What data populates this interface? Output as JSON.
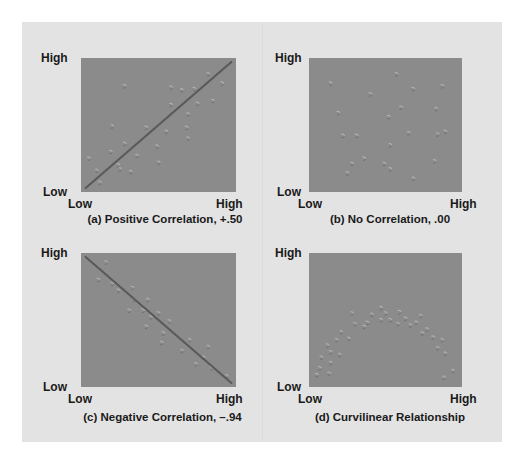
{
  "chart_data": [
    {
      "id": "a",
      "type": "scatter",
      "title": "(a) Positive Correlation, +.50",
      "xlabel": "",
      "ylabel": "",
      "x_ticks": [
        "Low",
        "High"
      ],
      "y_ticks": [
        "Low",
        "High"
      ],
      "xlim": [
        0,
        1
      ],
      "ylim": [
        0,
        1
      ],
      "grid": false,
      "trend_line": {
        "from": [
          0.03,
          0.03
        ],
        "to": [
          0.97,
          0.97
        ]
      },
      "points": [
        [
          0.28,
          0.79
        ],
        [
          0.58,
          0.78
        ],
        [
          0.65,
          0.76
        ],
        [
          0.73,
          0.77
        ],
        [
          0.82,
          0.88
        ],
        [
          0.91,
          0.81
        ],
        [
          0.75,
          0.66
        ],
        [
          0.85,
          0.68
        ],
        [
          0.58,
          0.65
        ],
        [
          0.69,
          0.58
        ],
        [
          0.68,
          0.48
        ],
        [
          0.42,
          0.48
        ],
        [
          0.2,
          0.49
        ],
        [
          0.55,
          0.45
        ],
        [
          0.69,
          0.4
        ],
        [
          0.28,
          0.36
        ],
        [
          0.49,
          0.34
        ],
        [
          0.19,
          0.3
        ],
        [
          0.05,
          0.25
        ],
        [
          0.36,
          0.27
        ],
        [
          0.25,
          0.17
        ],
        [
          0.1,
          0.16
        ],
        [
          0.32,
          0.15
        ],
        [
          0.24,
          0.2
        ],
        [
          0.5,
          0.22
        ],
        [
          0.12,
          0.07
        ]
      ]
    },
    {
      "id": "b",
      "type": "scatter",
      "title": "(b) No Correlation, .00",
      "xlabel": "",
      "ylabel": "",
      "x_ticks": [
        "Low",
        "High"
      ],
      "y_ticks": [
        "Low",
        "High"
      ],
      "xlim": [
        0,
        1
      ],
      "ylim": [
        0,
        1
      ],
      "grid": false,
      "points": [
        [
          0.57,
          0.88
        ],
        [
          0.14,
          0.81
        ],
        [
          0.4,
          0.73
        ],
        [
          0.68,
          0.77
        ],
        [
          0.87,
          0.79
        ],
        [
          0.6,
          0.63
        ],
        [
          0.83,
          0.62
        ],
        [
          0.19,
          0.59
        ],
        [
          0.52,
          0.56
        ],
        [
          0.22,
          0.42
        ],
        [
          0.31,
          0.42
        ],
        [
          0.65,
          0.44
        ],
        [
          0.84,
          0.43
        ],
        [
          0.89,
          0.45
        ],
        [
          0.53,
          0.35
        ],
        [
          0.28,
          0.21
        ],
        [
          0.49,
          0.21
        ],
        [
          0.82,
          0.23
        ],
        [
          0.25,
          0.14
        ],
        [
          0.53,
          0.17
        ],
        [
          0.68,
          0.1
        ],
        [
          0.36,
          0.25
        ]
      ]
    },
    {
      "id": "c",
      "type": "scatter",
      "title": "(c) Negative Correlation, –.94",
      "xlabel": "",
      "ylabel": "",
      "x_ticks": [
        "Low",
        "High"
      ],
      "y_ticks": [
        "Low",
        "High"
      ],
      "xlim": [
        0,
        1
      ],
      "ylim": [
        0,
        1
      ],
      "grid": false,
      "trend_line": {
        "from": [
          0.03,
          0.97
        ],
        "to": [
          0.97,
          0.03
        ]
      },
      "points": [
        [
          0.16,
          0.93
        ],
        [
          0.11,
          0.8
        ],
        [
          0.2,
          0.77
        ],
        [
          0.24,
          0.72
        ],
        [
          0.33,
          0.74
        ],
        [
          0.34,
          0.65
        ],
        [
          0.43,
          0.65
        ],
        [
          0.31,
          0.57
        ],
        [
          0.4,
          0.57
        ],
        [
          0.5,
          0.55
        ],
        [
          0.45,
          0.52
        ],
        [
          0.57,
          0.49
        ],
        [
          0.42,
          0.45
        ],
        [
          0.53,
          0.4
        ],
        [
          0.52,
          0.33
        ],
        [
          0.7,
          0.35
        ],
        [
          0.65,
          0.27
        ],
        [
          0.82,
          0.3
        ],
        [
          0.79,
          0.22
        ],
        [
          0.74,
          0.17
        ],
        [
          0.84,
          0.14
        ],
        [
          0.94,
          0.08
        ]
      ]
    },
    {
      "id": "d",
      "type": "scatter",
      "title": "(d) Curvilinear Relationship",
      "xlabel": "",
      "ylabel": "",
      "x_ticks": [
        "Low",
        "High"
      ],
      "y_ticks": [
        "Low",
        "High"
      ],
      "xlim": [
        0,
        1
      ],
      "ylim": [
        0,
        1
      ],
      "grid": false,
      "points": [
        [
          0.05,
          0.09
        ],
        [
          0.07,
          0.14
        ],
        [
          0.13,
          0.1
        ],
        [
          0.08,
          0.22
        ],
        [
          0.14,
          0.18
        ],
        [
          0.14,
          0.26
        ],
        [
          0.2,
          0.24
        ],
        [
          0.12,
          0.31
        ],
        [
          0.18,
          0.35
        ],
        [
          0.26,
          0.36
        ],
        [
          0.21,
          0.41
        ],
        [
          0.3,
          0.47
        ],
        [
          0.36,
          0.45
        ],
        [
          0.28,
          0.55
        ],
        [
          0.38,
          0.48
        ],
        [
          0.41,
          0.54
        ],
        [
          0.47,
          0.5
        ],
        [
          0.5,
          0.55
        ],
        [
          0.53,
          0.5
        ],
        [
          0.58,
          0.47
        ],
        [
          0.63,
          0.51
        ],
        [
          0.66,
          0.46
        ],
        [
          0.7,
          0.48
        ],
        [
          0.73,
          0.53
        ],
        [
          0.77,
          0.43
        ],
        [
          0.81,
          0.37
        ],
        [
          0.74,
          0.4
        ],
        [
          0.87,
          0.35
        ],
        [
          0.84,
          0.29
        ],
        [
          0.89,
          0.25
        ],
        [
          0.94,
          0.12
        ],
        [
          0.88,
          0.07
        ],
        [
          0.47,
          0.59
        ],
        [
          0.59,
          0.56
        ]
      ]
    }
  ],
  "colors": {
    "page_bg": "#ffffff",
    "panel_bg": "#e3e3e3",
    "plot_bg": "#8b8b8b",
    "trend_line": "#5a5a5a",
    "point_light": "#b2b2b2",
    "point_dark": "#6f6f6f",
    "text": "#1a1a1a"
  }
}
